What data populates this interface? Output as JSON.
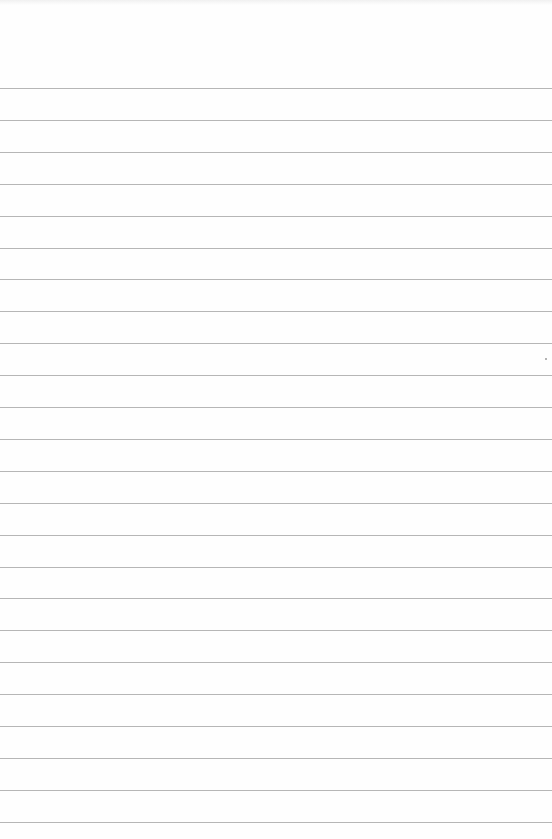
{
  "page": {
    "type": "lined-paper",
    "background_color": "#fefefe",
    "rule_color": "#a9a9a9",
    "rules": {
      "count": 24,
      "first_y": 88,
      "spacing": 31.9
    },
    "marks": [
      {
        "x": 545,
        "y": 358
      }
    ]
  }
}
